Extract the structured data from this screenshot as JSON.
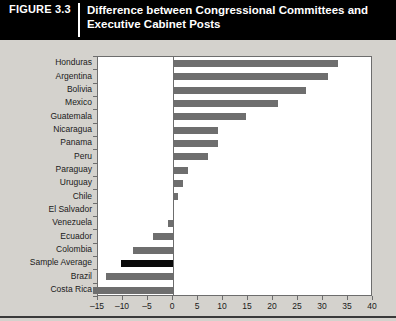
{
  "header": {
    "figure_label": "FIGURE",
    "figure_number": "3.3",
    "title_line1": "Difference between Congressional Committees and",
    "title_line2": "Executive Cabinet Posts"
  },
  "colors": {
    "header_background": "#000000",
    "header_text": "#ffffff",
    "panel_background": "#d4d2cd",
    "plot_background": "#ffffff",
    "bar": "#6e6e6e",
    "bar_highlight": "#0a0a0a",
    "axis": "#6d6d6d"
  },
  "chart_data": {
    "type": "bar",
    "orientation": "horizontal",
    "title": "Difference between Congressional Committees and Executive Cabinet Posts",
    "xlabel": "",
    "ylabel": "",
    "xlim": [
      -15,
      40
    ],
    "xticks": [
      -15,
      -10,
      -5,
      0,
      5,
      10,
      15,
      20,
      25,
      30,
      35,
      40
    ],
    "xtick_labels": [
      "–15",
      "–10",
      "–5",
      "0",
      "5",
      "10",
      "15",
      "20",
      "25",
      "30",
      "35",
      "40"
    ],
    "grid": false,
    "legend": null,
    "highlight_category": "Sample Average",
    "categories": [
      "Honduras",
      "Argentina",
      "Bolivia",
      "Mexico",
      "Guatemala",
      "Nicaragua",
      "Panama",
      "Peru",
      "Paraguay",
      "Uruguay",
      "Chile",
      "El Salvador",
      "Venezuela",
      "Ecuador",
      "Colombia",
      "Sample Average",
      "Brazil",
      "Costa Rica"
    ],
    "values": [
      33,
      31,
      26.5,
      21,
      14.5,
      9,
      9,
      7,
      3,
      2,
      1,
      0,
      -1,
      -4,
      -8,
      -10.5,
      -13.5,
      -16
    ]
  }
}
